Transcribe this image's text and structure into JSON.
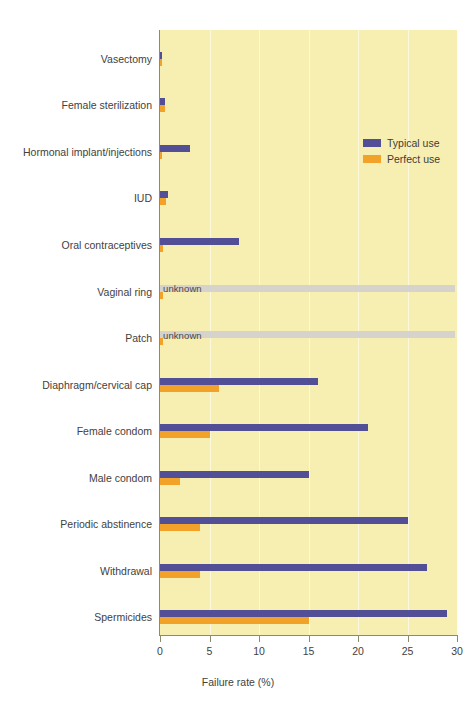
{
  "chart_data": {
    "type": "bar",
    "orientation": "horizontal",
    "title": "",
    "xlabel": "Failure rate (%)",
    "ylabel": "",
    "xlim": [
      0,
      30
    ],
    "xticks": [
      "0",
      "5",
      "10",
      "15",
      "20",
      "25",
      "30"
    ],
    "xtick_values": [
      0,
      5,
      10,
      15,
      20,
      25,
      30
    ],
    "grid": true,
    "grid_axis": "x",
    "legend_position": "top-right",
    "categories": [
      "Vasectomy",
      "Female sterilization",
      "Hormonal implant/injections",
      "IUD",
      "Oral contraceptives",
      "Vaginal ring",
      "Patch",
      "Diaphragm/cervical cap",
      "Female condom",
      "Male condom",
      "Periodic abstinence",
      "Withdrawal",
      "Spermicides"
    ],
    "series": [
      {
        "name": "Typical use",
        "color": "#534F96",
        "values": [
          0.15,
          0.5,
          3.0,
          0.8,
          8.0,
          null,
          null,
          16.0,
          21.0,
          15.0,
          25.0,
          27.0,
          29.0
        ]
      },
      {
        "name": "Perfect use",
        "color": "#F2A229",
        "values": [
          0.1,
          0.5,
          0.1,
          0.6,
          0.3,
          0.3,
          0.3,
          6.0,
          5.0,
          2.0,
          4.0,
          4.0,
          15.0
        ]
      }
    ],
    "unknown_label": "unknown",
    "unknown_categories": [
      "Vaginal ring",
      "Patch"
    ],
    "colors": {
      "plot_background": "#F7EFB2",
      "gridline": "#FCF8DC",
      "axis": "#8d8a6e",
      "typical_use": "#534F96",
      "perfect_use": "#F2A229",
      "unknown_bar": "#D6D2CC",
      "text": "#44413c"
    }
  },
  "legend": {
    "items": [
      {
        "label": "Typical use",
        "color": "#534F96"
      },
      {
        "label": "Perfect use",
        "color": "#F2A229"
      }
    ]
  }
}
